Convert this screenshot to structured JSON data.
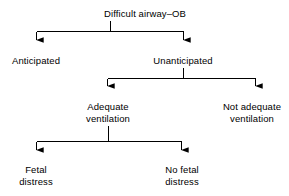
{
  "diagram": {
    "title": "Difficult airway–OB",
    "type": "flowchart",
    "orientation": "top-down",
    "line_color": "#000000",
    "text_color": "#000000",
    "background_color": "#ffffff",
    "nodes": [
      {
        "id": "root",
        "lines": [
          "Difficult airway–OB"
        ],
        "level": 0,
        "x": 145,
        "y": 8
      },
      {
        "id": "anticipated",
        "lines": [
          "Anticipated"
        ],
        "level": 1,
        "x": 36,
        "y": 55
      },
      {
        "id": "unanticipated",
        "lines": [
          "Unanticipated"
        ],
        "level": 1,
        "x": 183,
        "y": 55
      },
      {
        "id": "adequate-ventilation",
        "lines": [
          "Adequate",
          "ventilation"
        ],
        "level": 2,
        "x": 108,
        "y": 101
      },
      {
        "id": "not-adequate-ventilation",
        "lines": [
          "Not adequate",
          "ventilation"
        ],
        "level": 2,
        "x": 252,
        "y": 101
      },
      {
        "id": "fetal-distress",
        "lines": [
          "Fetal",
          "distress"
        ],
        "level": 3,
        "x": 36,
        "y": 164
      },
      {
        "id": "no-fetal-distress",
        "lines": [
          "No fetal",
          "distress"
        ],
        "level": 3,
        "x": 182,
        "y": 164
      }
    ],
    "edges": [
      {
        "from": "root",
        "to": "anticipated"
      },
      {
        "from": "root",
        "to": "unanticipated"
      },
      {
        "from": "unanticipated",
        "to": "adequate-ventilation"
      },
      {
        "from": "unanticipated",
        "to": "not-adequate-ventilation"
      },
      {
        "from": "adequate-ventilation",
        "to": "fetal-distress"
      },
      {
        "from": "adequate-ventilation",
        "to": "no-fetal-distress"
      }
    ]
  }
}
